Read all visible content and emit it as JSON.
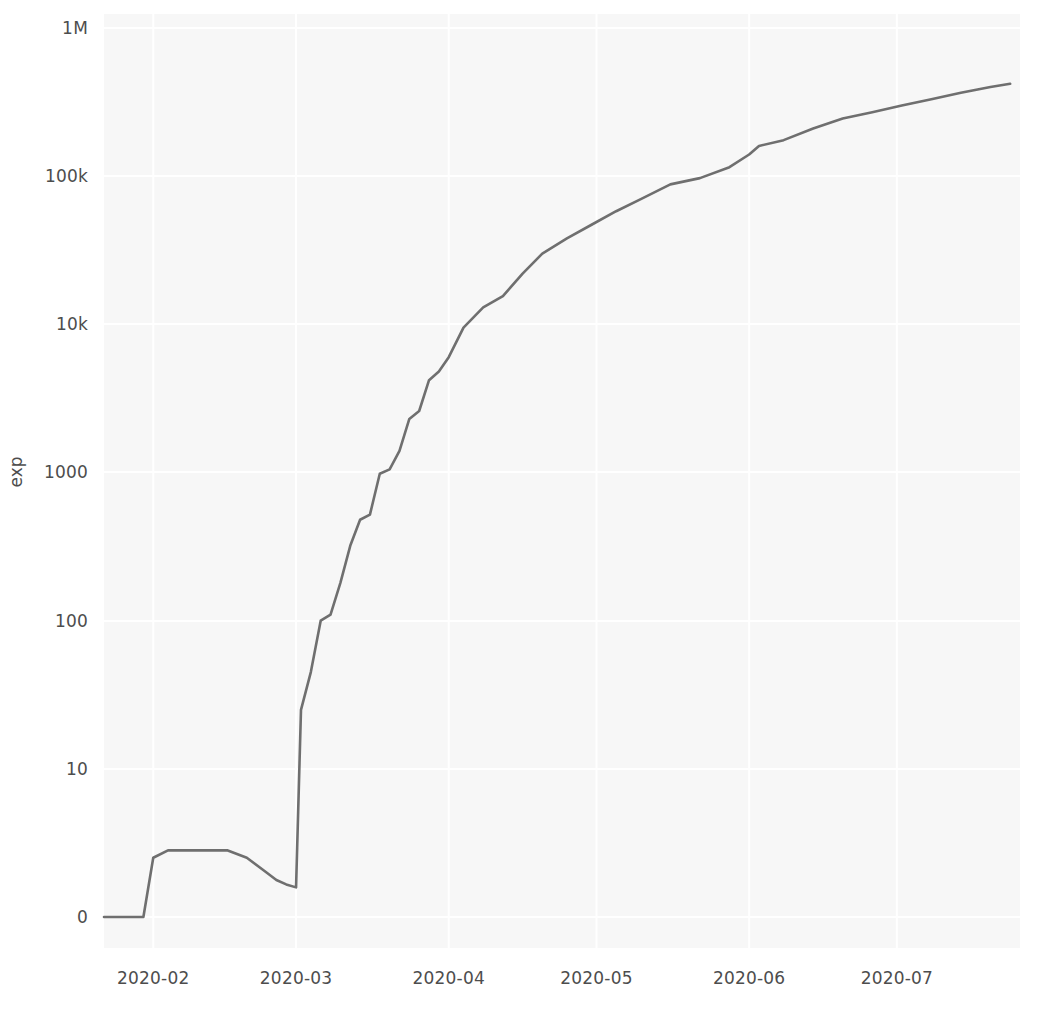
{
  "chart_data": {
    "type": "line",
    "title": "",
    "subtitle": "",
    "xlabel": "",
    "ylabel": "exp",
    "yscale": "symlog",
    "grid": true,
    "legend": null,
    "line_color": "#6f6f6f",
    "background_color": "#f7f7f7",
    "grid_color": "#ffffff",
    "y_ticks": [
      {
        "label": "1M",
        "value": 1000000
      },
      {
        "label": "100k",
        "value": 100000
      },
      {
        "label": "10k",
        "value": 10000
      },
      {
        "label": "1000",
        "value": 1000
      },
      {
        "label": "100",
        "value": 100
      },
      {
        "label": "10",
        "value": 10
      },
      {
        "label": "0",
        "value": 0
      }
    ],
    "x_ticks": [
      {
        "label": "2020-02",
        "value": "2020-02-01"
      },
      {
        "label": "2020-03",
        "value": "2020-03-01"
      },
      {
        "label": "2020-04",
        "value": "2020-04-01"
      },
      {
        "label": "2020-05",
        "value": "2020-05-01"
      },
      {
        "label": "2020-06",
        "value": "2020-06-01"
      },
      {
        "label": "2020-07",
        "value": "2020-07-01"
      }
    ],
    "xlim": [
      "2020-01-22",
      "2020-07-26"
    ],
    "ylim": [
      0,
      1000000
    ],
    "series": [
      {
        "name": "exp",
        "x": [
          "2020-01-22",
          "2020-01-25",
          "2020-01-28",
          "2020-01-30",
          "2020-02-01",
          "2020-02-04",
          "2020-02-08",
          "2020-02-12",
          "2020-02-16",
          "2020-02-20",
          "2020-02-24",
          "2020-02-26",
          "2020-02-28",
          "2020-03-01",
          "2020-03-02",
          "2020-03-04",
          "2020-03-06",
          "2020-03-08",
          "2020-03-10",
          "2020-03-12",
          "2020-03-14",
          "2020-03-16",
          "2020-03-18",
          "2020-03-20",
          "2020-03-22",
          "2020-03-24",
          "2020-03-26",
          "2020-03-28",
          "2020-03-30",
          "2020-04-01",
          "2020-04-04",
          "2020-04-08",
          "2020-04-12",
          "2020-04-16",
          "2020-04-20",
          "2020-04-25",
          "2020-04-30",
          "2020-05-05",
          "2020-05-10",
          "2020-05-16",
          "2020-05-22",
          "2020-05-28",
          "2020-06-01",
          "2020-06-03",
          "2020-06-08",
          "2020-06-14",
          "2020-06-20",
          "2020-06-26",
          "2020-07-02",
          "2020-07-08",
          "2020-07-14",
          "2020-07-20",
          "2020-07-24"
        ],
        "y": [
          0,
          0,
          0,
          0,
          4,
          4.5,
          4.5,
          4.5,
          4.5,
          4,
          3,
          2.5,
          2.2,
          2,
          25,
          45,
          100,
          110,
          180,
          320,
          480,
          520,
          980,
          1050,
          1400,
          2300,
          2600,
          4200,
          4800,
          6000,
          9500,
          13000,
          15500,
          22000,
          30000,
          38000,
          47000,
          58000,
          70000,
          88000,
          97000,
          115000,
          140000,
          160000,
          175000,
          210000,
          245000,
          270000,
          300000,
          330000,
          365000,
          400000,
          420000
        ]
      }
    ],
    "annotations": [
      {
        "text": "step increase",
        "x": "2020-03-02",
        "y": 25
      },
      {
        "text": "step increase",
        "x": "2020-05-28",
        "y": 97000
      },
      {
        "text": "step increase",
        "x": "2020-06-08",
        "y": 160000
      }
    ]
  },
  "axis": {
    "y_label": "exp"
  }
}
